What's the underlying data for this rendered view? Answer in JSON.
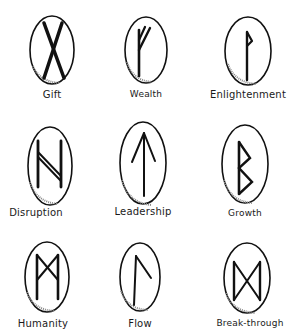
{
  "colors": {
    "ink": "#111111",
    "stone_fill": "#ffffff",
    "stone_shade": "#9a9a9a",
    "background": "#ffffff"
  },
  "runes": [
    {
      "label": "Gift",
      "glyph": "gebo",
      "stone": {
        "cx": 52,
        "cy": 50,
        "rx": 22,
        "ry": 34
      },
      "label_pos": {
        "x": 52,
        "y": 89
      }
    },
    {
      "label": "Wealth",
      "glyph": "fehu",
      "stone": {
        "cx": 146,
        "cy": 50,
        "rx": 21,
        "ry": 33
      },
      "label_pos": {
        "x": 146,
        "y": 89
      }
    },
    {
      "label": "Enlightenment",
      "glyph": "wunjo",
      "stone": {
        "cx": 248,
        "cy": 51,
        "rx": 23,
        "ry": 34
      },
      "label_pos": {
        "x": 248,
        "y": 89
      }
    },
    {
      "label": "Disruption",
      "glyph": "hagalaz",
      "stone": {
        "cx": 50,
        "cy": 166,
        "rx": 22,
        "ry": 39
      },
      "label_pos": {
        "x": 36,
        "y": 207
      }
    },
    {
      "label": "Leadership",
      "glyph": "tiwaz",
      "stone": {
        "cx": 143,
        "cy": 163,
        "rx": 23,
        "ry": 41
      },
      "label_pos": {
        "x": 143,
        "y": 206
      }
    },
    {
      "label": "Growth",
      "glyph": "berkano",
      "stone": {
        "cx": 245,
        "cy": 164,
        "rx": 23,
        "ry": 39
      },
      "label_pos": {
        "x": 245,
        "y": 208
      }
    },
    {
      "label": "Humanity",
      "glyph": "mannaz",
      "stone": {
        "cx": 47,
        "cy": 277,
        "rx": 22,
        "ry": 35
      },
      "label_pos": {
        "x": 43,
        "y": 318
      }
    },
    {
      "label": "Flow",
      "glyph": "laguz",
      "stone": {
        "cx": 140,
        "cy": 277,
        "rx": 20,
        "ry": 34
      },
      "label_pos": {
        "x": 140,
        "y": 318
      }
    },
    {
      "label": "Break-through",
      "glyph": "dagaz",
      "stone": {
        "cx": 247,
        "cy": 278,
        "rx": 23,
        "ry": 35
      },
      "label_pos": {
        "x": 250,
        "y": 318
      }
    }
  ]
}
